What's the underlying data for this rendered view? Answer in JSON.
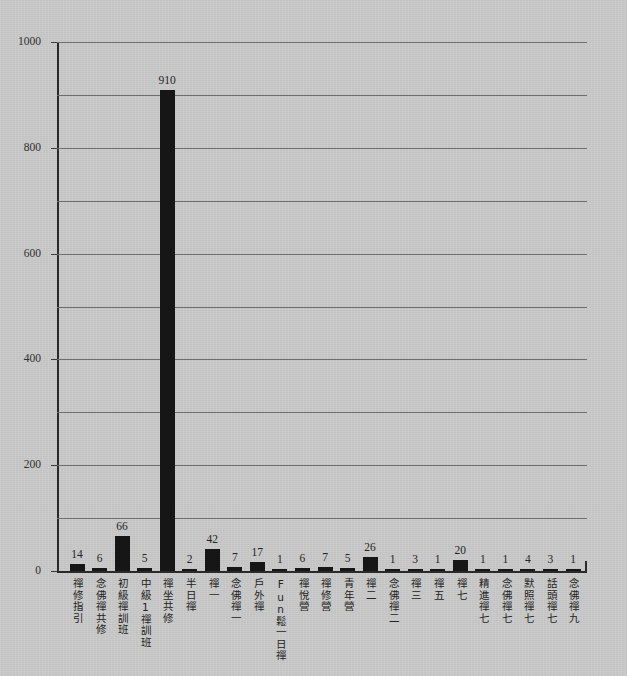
{
  "chart_data": {
    "type": "bar",
    "title": "",
    "subtitle": "",
    "xlabel": "",
    "ylabel": "",
    "ylim": [
      0,
      1000
    ],
    "yticks": [
      0,
      200,
      400,
      600,
      800,
      1000
    ],
    "ytick_labels": [
      "0",
      "200",
      "400",
      "600",
      "800",
      "1000"
    ],
    "gridline_interval": 100,
    "grid": true,
    "legend": "none",
    "bar_color": "#161616",
    "background_color": "#c9c9c9",
    "axis_color": "#2a2a2a",
    "gridline_color": "#6e6e6e",
    "data_labels_shown": true,
    "categories": [
      "禪修指引",
      "念佛禪共修",
      "初級禪訓班",
      "中級1禪訓班",
      "禪坐共修",
      "半日禪",
      "禪一",
      "念佛禪一",
      "戶外禪",
      "Fun鬆一日禪",
      "禪悅營",
      "禪修營",
      "青年營",
      "禪二",
      "念佛禪二",
      "禪三",
      "禪五",
      "禪七",
      "精進禪七",
      "念佛禪七",
      "默照禪七",
      "話頭禪七",
      "念佛禪九"
    ],
    "values": [
      14,
      6,
      66,
      5,
      910,
      2,
      42,
      7,
      17,
      1,
      6,
      7,
      5,
      26,
      1,
      3,
      1,
      20,
      1,
      1,
      4,
      3,
      1
    ],
    "value_labels": [
      "14",
      "6",
      "66",
      "5",
      "910",
      "2",
      "42",
      "7",
      "17",
      "1",
      "6",
      "7",
      "5",
      "26",
      "1",
      "3",
      "1",
      "20",
      "1",
      "1",
      "4",
      "3",
      "1"
    ]
  }
}
